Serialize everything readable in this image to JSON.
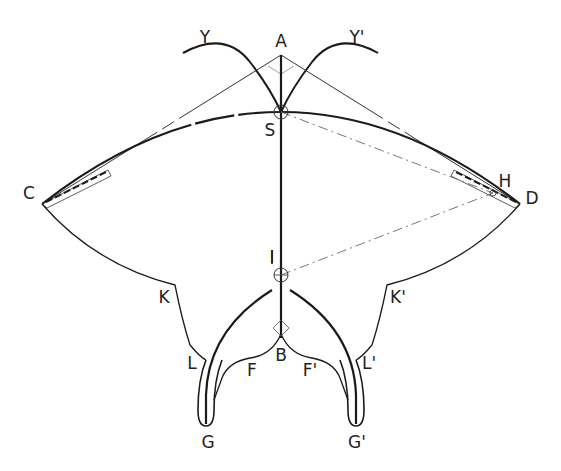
{
  "diagram": {
    "type": "geometric-construction",
    "caption_fragment": "",
    "colors": {
      "stroke": "#1a1a1a",
      "thin_stroke": "#333333",
      "dashed_stroke": "#666666",
      "label": "#222222",
      "background": "#ffffff"
    },
    "labels": {
      "A": "A",
      "Y": "Y",
      "Y_prime": "Y'",
      "S": "S",
      "C": "C",
      "D": "D",
      "H": "H",
      "I": "I",
      "K": "K",
      "K_prime": "K'",
      "L": "L",
      "L_prime": "L'",
      "B": "B",
      "F": "F",
      "F_prime": "F'",
      "G": "G",
      "G_prime": "G'"
    },
    "points": {
      "A": [
        281,
        55
      ],
      "S": [
        281,
        112
      ],
      "C": [
        42,
        204
      ],
      "D": [
        520,
        204
      ],
      "H": [
        493,
        193
      ],
      "I": [
        281,
        275
      ],
      "B": [
        281,
        330
      ],
      "G": [
        206,
        425
      ],
      "G_prime": [
        356,
        425
      ]
    }
  }
}
